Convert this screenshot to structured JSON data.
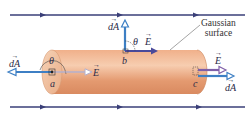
{
  "diagram": {
    "colors": {
      "field_line": "#3a3f78",
      "cylinder_body": "#e8a27a",
      "cylinder_end": "#f2c3a0",
      "vector_dA": "#3d7fc4",
      "vector_E": "#5a4fa0",
      "text": "#2a2a48"
    },
    "field_lines": [
      {
        "y": 15,
        "direction": "right"
      },
      {
        "y": 107,
        "direction": "right"
      }
    ],
    "labels": {
      "callout": "Gaussian\nsurface",
      "callout_line1": "Gaussian",
      "callout_line2": "surface",
      "point_a": "a",
      "point_b": "b",
      "point_c": "c",
      "theta_left": "θ",
      "theta_top": "θ",
      "dA_left": "dA",
      "E_left": "E",
      "dA_top": "dA",
      "E_top": "E",
      "E_right": "E",
      "dA_right": "dA"
    }
  }
}
